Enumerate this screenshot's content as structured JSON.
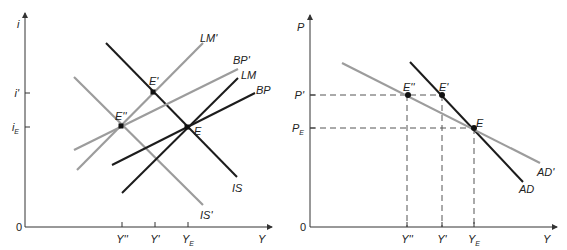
{
  "colors": {
    "black": "#1c1c1c",
    "gray": "#9c9c9c",
    "axis": "#333333",
    "dash": "#555555"
  },
  "left_panel": {
    "y_axis_label": "i",
    "x_axis_label": "Y",
    "origin_label": "0",
    "y_ticks": [
      {
        "main": "i",
        "prime": "'",
        "sub": "",
        "y": 93
      },
      {
        "main": "i",
        "prime": "",
        "sub": "E",
        "y": 127
      }
    ],
    "x_ticks": [
      {
        "main": "Y",
        "prime": "''",
        "sub": "",
        "x": 122
      },
      {
        "main": "Y",
        "prime": "'",
        "sub": "",
        "x": 155
      },
      {
        "main": "Y",
        "prime": "",
        "sub": "E",
        "x": 188
      }
    ],
    "curves": [
      {
        "name": "IS",
        "label": "IS",
        "color": "black",
        "x1": 106,
        "y1": 43,
        "x2": 237,
        "y2": 177,
        "lx": 232,
        "ly": 192
      },
      {
        "name": "IS'",
        "label": "IS'",
        "color": "gray",
        "x1": 74,
        "y1": 77,
        "x2": 203,
        "y2": 205,
        "lx": 200,
        "ly": 219
      },
      {
        "name": "LM",
        "label": "LM",
        "color": "black",
        "x1": 122,
        "y1": 193,
        "x2": 238,
        "y2": 78,
        "lx": 241,
        "ly": 79
      },
      {
        "name": "LM'",
        "label": "LM'",
        "color": "gray",
        "x1": 77,
        "y1": 170,
        "x2": 203,
        "y2": 43,
        "lx": 200,
        "ly": 42
      },
      {
        "name": "BP",
        "label": "BP",
        "color": "black",
        "x1": 112,
        "y1": 165,
        "x2": 255,
        "y2": 93,
        "lx": 256,
        "ly": 94
      },
      {
        "name": "BP'",
        "label": "BP'",
        "color": "gray",
        "x1": 74,
        "y1": 150,
        "x2": 238,
        "y2": 69,
        "lx": 233,
        "ly": 64
      }
    ],
    "points": [
      {
        "label": "E''",
        "x": 121,
        "y": 126,
        "lx": 115,
        "ly": 120
      },
      {
        "label": "E'",
        "x": 153,
        "y": 92,
        "lx": 149,
        "ly": 85
      },
      {
        "label": "E",
        "x": 187,
        "y": 127,
        "lx": 194,
        "ly": 135
      }
    ]
  },
  "right_panel": {
    "y_axis_label": "P",
    "x_axis_label": "Y",
    "origin_label": "0",
    "y_ticks": [
      {
        "main": "P",
        "prime": "'",
        "sub": "",
        "y": 95
      },
      {
        "main": "P",
        "prime": "",
        "sub": "E",
        "y": 128
      }
    ],
    "x_ticks": [
      {
        "main": "Y",
        "prime": "''",
        "sub": "",
        "x": 407
      },
      {
        "main": "Y",
        "prime": "'",
        "sub": "",
        "x": 442
      },
      {
        "main": "Y",
        "prime": "",
        "sub": "E",
        "x": 474
      }
    ],
    "curves": [
      {
        "name": "AD",
        "label": "AD",
        "color": "black",
        "x1": 410,
        "y1": 62,
        "x2": 523,
        "y2": 182,
        "lx": 519,
        "ly": 193
      },
      {
        "name": "AD'",
        "label": "AD'",
        "color": "gray",
        "x1": 342,
        "y1": 63,
        "x2": 540,
        "y2": 163,
        "lx": 537,
        "ly": 176
      }
    ],
    "points": [
      {
        "label": "E''",
        "x": 408,
        "y": 95,
        "lx": 403,
        "ly": 91
      },
      {
        "label": "E'",
        "x": 442,
        "y": 95,
        "lx": 439,
        "ly": 91
      },
      {
        "label": "E",
        "x": 474,
        "y": 128,
        "lx": 476,
        "ly": 127
      }
    ]
  }
}
